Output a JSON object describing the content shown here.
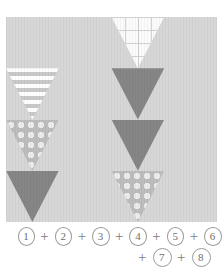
{
  "figure": {
    "colors": {
      "light": "#d7d7d7",
      "light_alt": "#dcdcdc",
      "medium": "#bbbbbb",
      "dark": "#868686",
      "dark_alt": "#8f8f8f",
      "grid_fill": "#fbfbfb",
      "grid_line": "#d2d2d2",
      "stripe_light": "#ffffff",
      "stripe_dark": "#c9c9c9",
      "dot": "#ececec",
      "dot_bg": "#bdbdbd",
      "caption_text": "#7d7d7d",
      "background": "#ffffff"
    }
  },
  "pattern": {
    "name": "triangle-grid",
    "rows": 4,
    "columns_per_row": 8,
    "cell_width": 52.75,
    "cell_height": 51.25,
    "tiles": [
      {
        "row": 0,
        "col": 0,
        "orientation": "half-up-left",
        "fill": "dark"
      },
      {
        "row": 0,
        "col": 0,
        "orientation": "up",
        "fill": "light"
      },
      {
        "row": 0,
        "col": 1,
        "orientation": "down",
        "fill": "grid"
      },
      {
        "row": 0,
        "col": 1,
        "orientation": "up",
        "fill": "light"
      },
      {
        "row": 0,
        "col": 2,
        "orientation": "down",
        "fill": "medium"
      },
      {
        "row": 0,
        "col": 2,
        "orientation": "up",
        "fill": "light"
      },
      {
        "row": 0,
        "col": 3,
        "orientation": "down",
        "fill": "stripe"
      },
      {
        "row": 0,
        "col": 3,
        "orientation": "up",
        "fill": "light"
      },
      {
        "row": 1,
        "col": 0,
        "orientation": "down",
        "fill": "stripe"
      },
      {
        "row": 1,
        "col": 0,
        "orientation": "up",
        "fill": "light"
      },
      {
        "row": 1,
        "col": 1,
        "orientation": "down",
        "fill": "dark"
      },
      {
        "row": 1,
        "col": 1,
        "orientation": "up",
        "fill": "light"
      },
      {
        "row": 1,
        "col": 2,
        "orientation": "down",
        "fill": "dots"
      },
      {
        "row": 1,
        "col": 2,
        "orientation": "up",
        "fill": "light"
      },
      {
        "row": 1,
        "col": 3,
        "orientation": "down",
        "fill": "light_alt"
      },
      {
        "row": 1,
        "col": 3,
        "orientation": "up",
        "fill": "light"
      },
      {
        "row": 2,
        "col": 0,
        "orientation": "down",
        "fill": "dots"
      },
      {
        "row": 2,
        "col": 0,
        "orientation": "up",
        "fill": "light"
      },
      {
        "row": 2,
        "col": 1,
        "orientation": "down",
        "fill": "dark"
      },
      {
        "row": 2,
        "col": 1,
        "orientation": "up",
        "fill": "light"
      },
      {
        "row": 2,
        "col": 2,
        "orientation": "down",
        "fill": "grid"
      },
      {
        "row": 2,
        "col": 2,
        "orientation": "up",
        "fill": "light"
      },
      {
        "row": 2,
        "col": 3,
        "orientation": "down",
        "fill": "medium"
      },
      {
        "row": 2,
        "col": 3,
        "orientation": "up",
        "fill": "light"
      },
      {
        "row": 3,
        "col": 0,
        "orientation": "down",
        "fill": "dark"
      },
      {
        "row": 3,
        "col": 0,
        "orientation": "up",
        "fill": "light"
      },
      {
        "row": 3,
        "col": 1,
        "orientation": "down",
        "fill": "dots"
      },
      {
        "row": 3,
        "col": 1,
        "orientation": "up",
        "fill": "light"
      },
      {
        "row": 3,
        "col": 2,
        "orientation": "down",
        "fill": "light_alt"
      },
      {
        "row": 3,
        "col": 2,
        "orientation": "up",
        "fill": "light"
      },
      {
        "row": 3,
        "col": 3,
        "orientation": "down",
        "fill": "light_alt"
      },
      {
        "row": 3,
        "col": 3,
        "orientation": "up",
        "fill": "grid"
      }
    ]
  },
  "caption": {
    "line1": [
      {
        "type": "number",
        "text": "1"
      },
      {
        "type": "operator",
        "text": "+"
      },
      {
        "type": "number",
        "text": "2"
      },
      {
        "type": "operator",
        "text": "+"
      },
      {
        "type": "number",
        "text": "3"
      },
      {
        "type": "operator",
        "text": "+"
      },
      {
        "type": "number",
        "text": "4"
      },
      {
        "type": "operator",
        "text": "+"
      },
      {
        "type": "number",
        "text": "5"
      },
      {
        "type": "operator",
        "text": "+"
      },
      {
        "type": "number",
        "text": "6"
      }
    ],
    "line2": [
      {
        "type": "operator",
        "text": "+"
      },
      {
        "type": "number",
        "text": "7"
      },
      {
        "type": "operator",
        "text": "+"
      },
      {
        "type": "number",
        "text": "8"
      }
    ],
    "plain_text": "1 + 2 + 3 + 4 + 5 + 6 + 7 + 8"
  }
}
